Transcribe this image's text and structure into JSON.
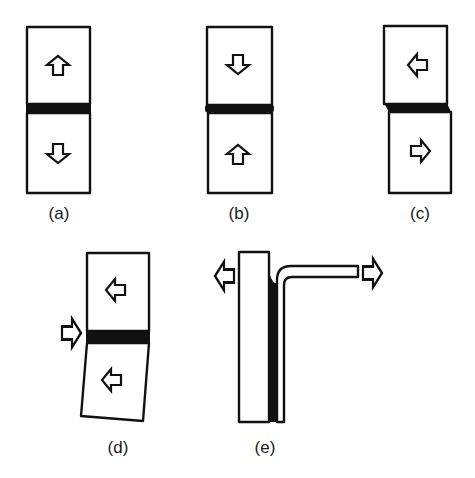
{
  "figure": {
    "colors": {
      "line": "#111111",
      "adhesive": "#111111",
      "background": "#ffffff"
    },
    "panels": [
      {
        "id": "a",
        "label": "(a)",
        "mode": "tension",
        "arrows": [
          "up-arrow in upper block",
          "down-arrow in lower block"
        ]
      },
      {
        "id": "b",
        "label": "(b)",
        "mode": "compression",
        "arrows": [
          "down-arrow in upper block",
          "up-arrow in lower block"
        ]
      },
      {
        "id": "c",
        "label": "(c)",
        "mode": "shear",
        "arrows": [
          "left-arrow in upper block",
          "right-arrow in lower block"
        ]
      },
      {
        "id": "d",
        "label": "(d)",
        "mode": "cleavage",
        "arrows": [
          "right-arrow applied at joint",
          "left-arrow in upper block",
          "left-arrow in lower block"
        ]
      },
      {
        "id": "e",
        "label": "(e)",
        "mode": "peel",
        "arrows": [
          "left-arrow on rigid adherend",
          "right-arrow on flexible adherend"
        ]
      }
    ]
  }
}
